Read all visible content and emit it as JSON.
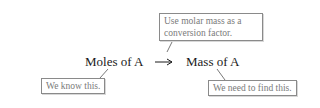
{
  "diagram": {
    "type": "conversion-flow",
    "nodes": {
      "start": "Moles of A",
      "end": "Mass of A"
    },
    "arrow_symbol": "⟶",
    "callouts": {
      "method": "Use molar mass as a conversion factor.",
      "method_line1": "Use molar mass as a",
      "method_line2": "conversion factor.",
      "known": "We know this.",
      "unknown": "We need to find this."
    }
  }
}
